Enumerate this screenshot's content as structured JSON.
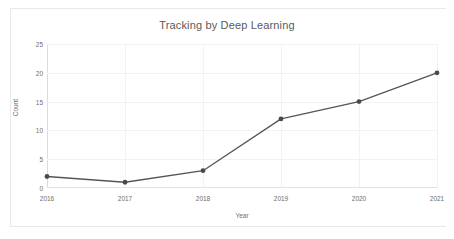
{
  "chart_data": {
    "type": "line",
    "title": "Tracking by Deep Learning",
    "xlabel": "Year",
    "ylabel": "Count",
    "categories": [
      "2016",
      "2017",
      "2018",
      "2019",
      "2020",
      "2021"
    ],
    "x": [
      2016,
      2017,
      2018,
      2019,
      2020,
      2021
    ],
    "values": [
      2,
      1,
      3,
      12,
      15,
      20
    ],
    "series": [
      {
        "name": "Count",
        "values": [
          2,
          1,
          3,
          12,
          15,
          20
        ]
      }
    ],
    "ylim": [
      0,
      25
    ],
    "yticks": [
      0,
      5,
      10,
      15,
      20,
      25
    ],
    "ytick_labels": [
      "0",
      "5",
      "10",
      "15",
      "20",
      "25"
    ],
    "xtick_labels": [
      "2016",
      "2017",
      "2018",
      "2019",
      "2020",
      "2021"
    ],
    "grid": true,
    "grid_axis": "both",
    "legend": false,
    "legend_position": "none",
    "marker": "circle",
    "line_color": "#555555",
    "marker_color": "#4a4a4a",
    "grid_color": "#f2f2f2",
    "axis_color": "#dcdcdc",
    "background_color": "#ffffff",
    "title_color": "#5a5a5a",
    "tick_color": "#6e6e6e"
  }
}
